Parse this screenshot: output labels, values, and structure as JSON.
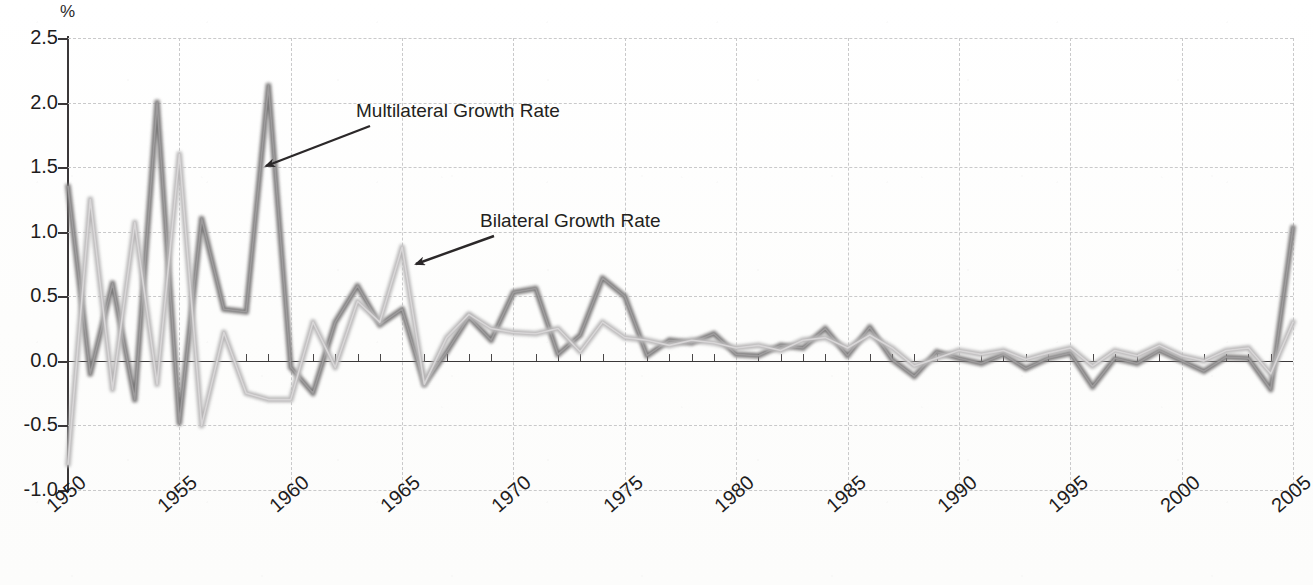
{
  "chart_data": {
    "type": "line",
    "title": "",
    "xlabel": "",
    "ylabel": "%",
    "ylim": [
      -1.0,
      2.5
    ],
    "xlim": [
      1950,
      2005
    ],
    "grid": true,
    "legend_position": "inline-annotations",
    "ytick_labels": [
      "2.5",
      "2.0",
      "1.5",
      "1.0",
      "0.5",
      "0.0",
      "-0.5",
      "-1.0"
    ],
    "ytick_values": [
      2.5,
      2.0,
      1.5,
      1.0,
      0.5,
      0.0,
      -0.5,
      -1.0
    ],
    "xtick_labels": [
      "1950",
      "1955",
      "1960",
      "1965",
      "1970",
      "1975",
      "1980",
      "1985",
      "1990",
      "1995",
      "2000",
      "2005"
    ],
    "xtick_values": [
      1950,
      1955,
      1960,
      1965,
      1970,
      1975,
      1980,
      1985,
      1990,
      1995,
      2000,
      2005
    ],
    "x": [
      1950,
      1951,
      1952,
      1953,
      1954,
      1955,
      1956,
      1957,
      1958,
      1959,
      1960,
      1961,
      1962,
      1963,
      1964,
      1965,
      1966,
      1967,
      1968,
      1969,
      1970,
      1971,
      1972,
      1973,
      1974,
      1975,
      1976,
      1977,
      1978,
      1979,
      1980,
      1981,
      1982,
      1983,
      1984,
      1985,
      1986,
      1987,
      1988,
      1989,
      1990,
      1991,
      1992,
      1993,
      1994,
      1995,
      1996,
      1997,
      1998,
      1999,
      2000,
      2001,
      2002,
      2003,
      2004,
      2005
    ],
    "series": [
      {
        "name": "Multilateral Growth Rate",
        "color": "#7d7b7c",
        "values": [
          1.35,
          -0.1,
          0.6,
          -0.3,
          2.0,
          -0.48,
          1.1,
          0.4,
          0.38,
          2.13,
          -0.05,
          -0.25,
          0.3,
          0.58,
          0.28,
          0.4,
          -0.18,
          0.07,
          0.34,
          0.16,
          0.53,
          0.56,
          0.05,
          0.2,
          0.64,
          0.5,
          0.04,
          0.16,
          0.14,
          0.21,
          0.05,
          0.04,
          0.12,
          0.1,
          0.25,
          0.04,
          0.26,
          0.01,
          -0.12,
          0.07,
          0.02,
          -0.02,
          0.05,
          -0.06,
          0.02,
          0.06,
          -0.2,
          0.02,
          -0.02,
          0.08,
          0.0,
          -0.08,
          0.03,
          0.02,
          -0.22,
          1.03
        ]
      },
      {
        "name": "Bilateral Growth Rate",
        "color": "#b9b7b8",
        "values": [
          -0.8,
          1.25,
          -0.22,
          1.07,
          -0.18,
          1.6,
          -0.5,
          0.22,
          -0.25,
          -0.3,
          -0.3,
          0.3,
          -0.05,
          0.46,
          0.3,
          0.88,
          -0.18,
          0.18,
          0.36,
          0.25,
          0.22,
          0.21,
          0.25,
          0.07,
          0.3,
          0.18,
          0.16,
          0.12,
          0.16,
          0.14,
          0.1,
          0.12,
          0.08,
          0.16,
          0.18,
          0.1,
          0.2,
          0.1,
          -0.04,
          0.02,
          0.08,
          0.05,
          0.08,
          0.01,
          0.06,
          0.1,
          -0.04,
          0.08,
          0.04,
          0.12,
          0.04,
          0.0,
          0.08,
          0.1,
          -0.1,
          0.3
        ]
      }
    ],
    "annotations": [
      {
        "text": "Multilateral Growth Rate",
        "series": "Multilateral Growth Rate",
        "points_to_year": 1959
      },
      {
        "text": "Bilateral Growth Rate",
        "series": "Bilateral Growth Rate",
        "points_to_year": 1965
      }
    ]
  },
  "axes": {
    "y_unit_label": "%"
  }
}
